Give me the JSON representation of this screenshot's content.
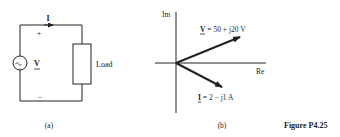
{
  "figure": {
    "caption": "Figure P4.25",
    "colors": {
      "ink": "#222222",
      "background": "#ffffff"
    }
  },
  "circuit": {
    "sublabel": "(a)",
    "current_label": "I",
    "voltage_label": "V",
    "plus_sign": "+",
    "minus_sign": "−",
    "load_label": "Load",
    "source_icon": "ac-voltage-source-icon"
  },
  "phasor": {
    "sublabel": "(b)",
    "axis_im_label": "Im",
    "axis_re_label": "Re",
    "v_label_symbol": "V",
    "v_label_value": " = 50 + j20 V",
    "i_label_symbol": "I",
    "i_label_value": " = 2 − j1 A",
    "vectors": [
      {
        "name": "V",
        "re": 50,
        "im": 20,
        "unit": "V"
      },
      {
        "name": "I",
        "re": 2,
        "im": -1,
        "unit": "A"
      }
    ]
  }
}
